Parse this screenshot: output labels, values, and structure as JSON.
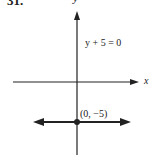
{
  "problem_number": "31.",
  "axes": {
    "x_label": "x",
    "y_label": "y"
  },
  "equation": "y + 5 = 0",
  "point": {
    "label": "(0, −5)",
    "x": 0,
    "y": -5
  },
  "colors": {
    "ink": "#222222",
    "background": "#ffffff"
  }
}
